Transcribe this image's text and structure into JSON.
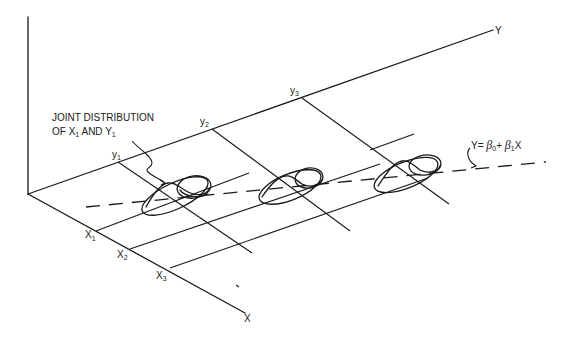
{
  "diagram": {
    "axes": {
      "y_axis_label": "Y",
      "x_axis_label": "X"
    },
    "y_ticks": [
      {
        "label": "y",
        "sub": "1"
      },
      {
        "label": "y",
        "sub": "2"
      },
      {
        "label": "y",
        "sub": "3"
      }
    ],
    "x_ticks": [
      {
        "label": "X",
        "sub": "1"
      },
      {
        "label": "X",
        "sub": "2"
      },
      {
        "label": "X",
        "sub": "3"
      }
    ],
    "annotation": {
      "line1": "JOINT DISTRIBUTION",
      "line2_prefix": "OF X",
      "line2_sub1": "1",
      "line2_mid": " AND Y",
      "line2_sub2": "1"
    },
    "regression_line": {
      "prefix": "Y= ",
      "beta0": "β",
      "beta0_sub": "0",
      "plus": "+ ",
      "beta1": "β",
      "beta1_sub": "1",
      "suffix": "X"
    }
  }
}
